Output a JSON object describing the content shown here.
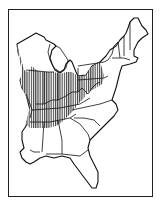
{
  "map": {
    "title": "Range map of eastern United States",
    "region": "Eastern United States",
    "style": "black-and-white line art",
    "range_pattern": "vertical hatching",
    "range_description": "Hatched range covering the Ohio Valley and Midwest: southern Wisconsin, Iowa edge, Illinois, Indiana, Ohio, Kentucky, Tennessee, western Pennsylvania, West Virginia, western Virginia/Maryland, southern Michigan edge, northern Mississippi and Alabama",
    "colors": {
      "line": "#111111",
      "background": "#ffffff",
      "hatch": "#111111"
    },
    "states_shown": [
      "Wisconsin",
      "Michigan",
      "Illinois",
      "Indiana",
      "Ohio",
      "Kentucky",
      "Tennessee",
      "Pennsylvania",
      "New York",
      "West Virginia",
      "Virginia",
      "Maryland",
      "Delaware",
      "New Jersey",
      "Connecticut",
      "Rhode Island",
      "Massachusetts",
      "Vermont",
      "New Hampshire",
      "Maine",
      "North Carolina",
      "South Carolina",
      "Georgia",
      "Florida",
      "Alabama",
      "Mississippi",
      "Louisiana"
    ]
  }
}
